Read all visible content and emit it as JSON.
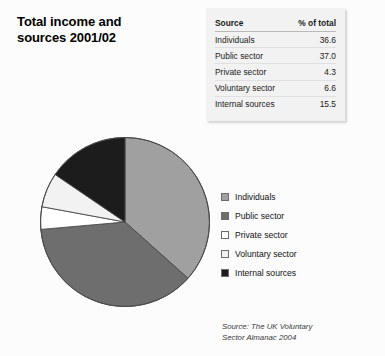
{
  "title": {
    "line1": "Total income and",
    "line2": "sources 2001/02"
  },
  "table": {
    "headers": [
      "Source",
      "% of total"
    ],
    "rows": [
      {
        "source": "Individuals",
        "percent": "36.6"
      },
      {
        "source": "Public sector",
        "percent": "37.0"
      },
      {
        "source": "Private sector",
        "percent": "4.3"
      },
      {
        "source": "Voluntary sector",
        "percent": "6.6"
      },
      {
        "source": "Internal sources",
        "percent": "15.5"
      }
    ]
  },
  "legend": {
    "items": [
      {
        "label": "Individuals",
        "color": "#a0a0a0"
      },
      {
        "label": "Public sector",
        "color": "#6e6e6e"
      },
      {
        "label": "Private sector",
        "color": "#ffffff"
      },
      {
        "label": "Voluntary sector",
        "color": "#f2f2f2"
      },
      {
        "label": "Internal sources",
        "color": "#1c1c1c"
      }
    ]
  },
  "source_note": {
    "line1": "Source: The UK Voluntary",
    "line2": "Sector Almanac 2004"
  },
  "chart_data": {
    "type": "pie",
    "title": "Total income and sources 2001/02",
    "unit": "% of total",
    "start_angle_deg": 0,
    "direction": "clockwise",
    "legend_position": "right",
    "categories": [
      "Individuals",
      "Public sector",
      "Private sector",
      "Voluntary sector",
      "Internal sources"
    ],
    "values": [
      36.6,
      37.0,
      4.3,
      6.6,
      15.5
    ],
    "colors": [
      "#a0a0a0",
      "#6e6e6e",
      "#ffffff",
      "#f2f2f2",
      "#1c1c1c"
    ],
    "total": 100.0,
    "source": "The UK Voluntary Sector Almanac 2004"
  }
}
